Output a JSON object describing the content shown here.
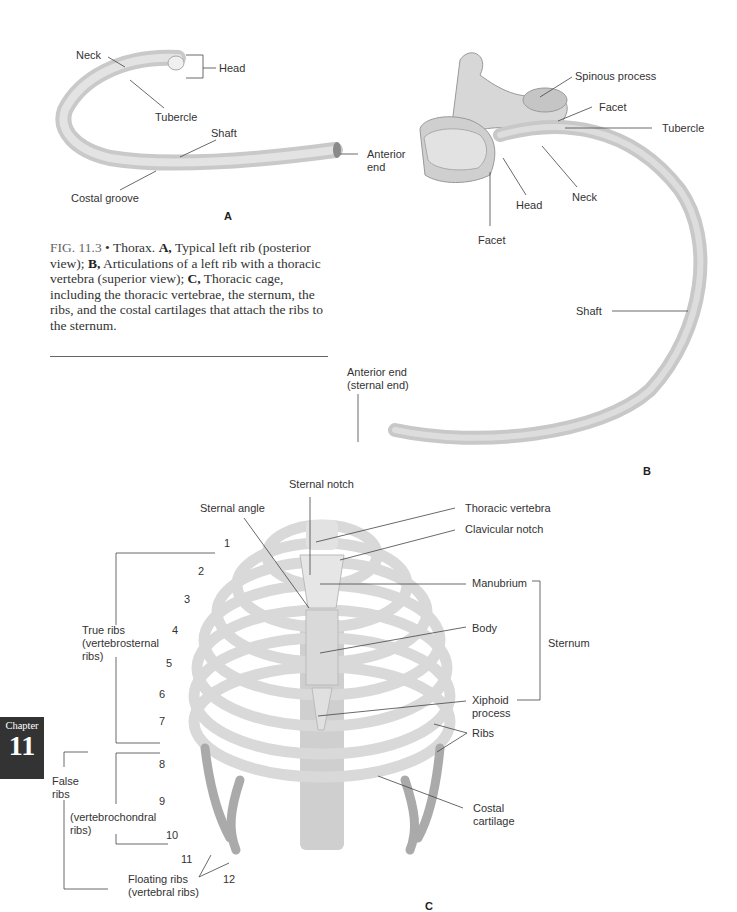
{
  "figure": {
    "caption": {
      "fig_number": "FIG. 11.3",
      "bullet": "•",
      "intro": " Thorax. ",
      "a_label": "A,",
      "a_text": " Typical left rib (posterior view); ",
      "b_label": "B,",
      "b_text": " Articulations of a left rib with a thoracic vertebra (superior view); ",
      "c_label": "C,",
      "c_text": " Thoracic cage, including the thoracic vertebrae, the sternum, the ribs, and the costal cartilages that attach the ribs to the sternum."
    },
    "panel_a": {
      "letter": "A",
      "labels": {
        "neck": "Neck",
        "head": "Head",
        "tubercle": "Tubercle",
        "shaft": "Shaft",
        "anterior_end_1": "Anterior",
        "anterior_end_2": "end",
        "costal_groove": "Costal groove"
      }
    },
    "panel_b": {
      "letter": "B",
      "labels": {
        "spinous_process": "Spinous process",
        "facet_top": "Facet",
        "tubercle": "Tubercle",
        "neck": "Neck",
        "head": "Head",
        "facet_bottom": "Facet",
        "shaft": "Shaft",
        "anterior_end_1": "Anterior end",
        "anterior_end_2": "(sternal end)"
      }
    },
    "panel_c": {
      "letter": "C",
      "labels": {
        "sternal_notch": "Sternal notch",
        "sternal_angle": "Sternal angle",
        "thoracic_vertebra": "Thoracic vertebra",
        "clavicular_notch": "Clavicular notch",
        "manubrium": "Manubrium",
        "body": "Body",
        "sternum": "Sternum",
        "xiphoid_1": "Xiphoid",
        "xiphoid_2": "process",
        "ribs": "Ribs",
        "costal_cartilage_1": "Costal",
        "costal_cartilage_2": "cartilage",
        "true_ribs_1": "True ribs",
        "true_ribs_2": "(vertebrosternal",
        "true_ribs_3": "ribs)",
        "false_ribs_1": "False",
        "false_ribs_2": "ribs",
        "vertebrochondral_1": "(vertebrochondral",
        "vertebrochondral_2": "ribs)",
        "floating_1": "Floating ribs",
        "floating_2": "(vertebral ribs)"
      },
      "rib_numbers": [
        "1",
        "2",
        "3",
        "4",
        "5",
        "6",
        "7",
        "8",
        "9",
        "10",
        "11",
        "12"
      ]
    }
  },
  "chapter_tab": {
    "word": "Chapter",
    "number": "11"
  }
}
